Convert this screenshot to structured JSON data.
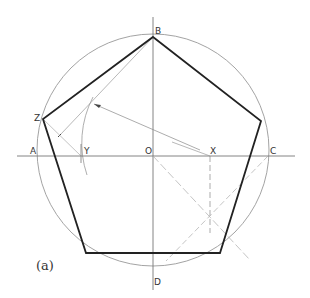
{
  "diagram": {
    "caption": "(a)",
    "points": {
      "A": "A",
      "B": "B",
      "C": "C",
      "D": "D",
      "O": "O",
      "X": "X",
      "Y": "Y",
      "Z": "Z"
    }
  },
  "colors": {
    "outline": "#222222",
    "construction": "#888888",
    "circle": "#999999"
  }
}
